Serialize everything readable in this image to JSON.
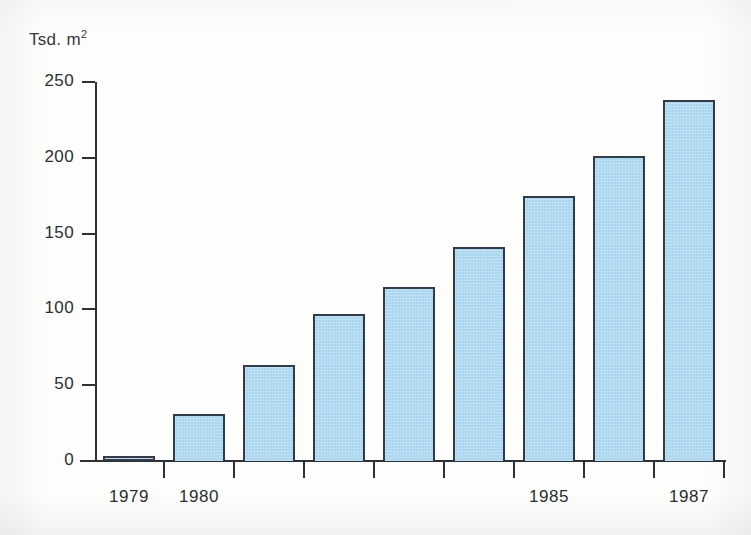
{
  "chart_data": {
    "type": "bar",
    "title": "",
    "subtitle": "",
    "xlabel": "",
    "ylabel": "Tsd. m",
    "ylabel_superscript": "2",
    "ylabel_full": "Tsd. m2",
    "categories": [
      "1979",
      "1980",
      "1981",
      "1982",
      "1983",
      "1984",
      "1985",
      "1986",
      "1987"
    ],
    "values": [
      3,
      31,
      63,
      97,
      115,
      141,
      175,
      201,
      238
    ],
    "visible_tick_labels": [
      "1979",
      "1980",
      "",
      "",
      "",
      "",
      "1985",
      "",
      "1987"
    ],
    "ylim": [
      0,
      250
    ],
    "yticks": [
      0,
      50,
      100,
      150,
      200,
      250
    ],
    "ytick_labels": [
      "0",
      "50",
      "100",
      "150",
      "200",
      "250"
    ],
    "grid": false,
    "legend": null,
    "bar_color": "#a9d6ef",
    "bar_border_color": "#343b48",
    "axis_color": "#2c3138",
    "background_color": "#fdfdfb"
  },
  "axes": {
    "y_label_text": "Tsd. m",
    "y_label_exponent": "2",
    "y_ticks": [
      {
        "value": 250,
        "label": "250"
      },
      {
        "value": 200,
        "label": "200"
      },
      {
        "value": 150,
        "label": "150"
      },
      {
        "value": 100,
        "label": "100"
      },
      {
        "value": 50,
        "label": "50"
      },
      {
        "value": 0,
        "label": "0"
      }
    ],
    "x_ticks": [
      {
        "label": "1979"
      },
      {
        "label": "1980"
      },
      {
        "label": ""
      },
      {
        "label": ""
      },
      {
        "label": ""
      },
      {
        "label": ""
      },
      {
        "label": "1985"
      },
      {
        "label": ""
      },
      {
        "label": "1987"
      }
    ]
  },
  "bars": [
    {
      "category": "1979",
      "value": 3,
      "label": "1979"
    },
    {
      "category": "1980",
      "value": 31,
      "label": "1980"
    },
    {
      "category": "1981",
      "value": 63,
      "label": ""
    },
    {
      "category": "1982",
      "value": 97,
      "label": ""
    },
    {
      "category": "1983",
      "value": 115,
      "label": ""
    },
    {
      "category": "1984",
      "value": 141,
      "label": ""
    },
    {
      "category": "1985",
      "value": 175,
      "label": "1985"
    },
    {
      "category": "1986",
      "value": 201,
      "label": ""
    },
    {
      "category": "1987",
      "value": 238,
      "label": "1987"
    }
  ]
}
